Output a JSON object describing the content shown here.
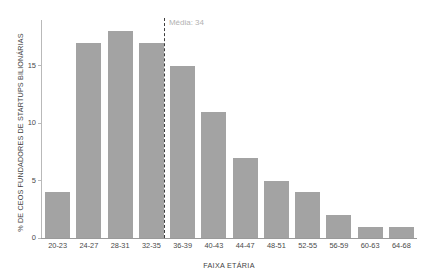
{
  "chart_data": {
    "type": "bar",
    "title": "",
    "xlabel": "FAIXA ETÁRIA",
    "ylabel": "% DE CEOS FUNDADORES DE STARTUPS BILIONÁRIAS",
    "categories": [
      "20-23",
      "24-27",
      "28-31",
      "32-35",
      "36-39",
      "40-43",
      "44-47",
      "48-51",
      "52-55",
      "56-59",
      "60-63",
      "64-68"
    ],
    "values": [
      4,
      17,
      18,
      17,
      15,
      11,
      7,
      5,
      4,
      2,
      1,
      1
    ],
    "ylim": [
      0,
      19
    ],
    "yticks": [
      0,
      5,
      10,
      15
    ],
    "ytick_labels": [
      "0",
      "5",
      "10",
      "15"
    ],
    "grid": false,
    "legend": null,
    "bar_color": "#a3a3a3",
    "annotations": [
      {
        "name": "mean-line",
        "label": "Média: 34",
        "value": 34,
        "category_edge_index": 3,
        "style": "dashed",
        "color": "#3d3d3d",
        "label_color": "#b2b2b2"
      }
    ]
  },
  "axis": {
    "y_line_color": "#b9b9b9",
    "x_line_color": "#9a9a9a"
  }
}
